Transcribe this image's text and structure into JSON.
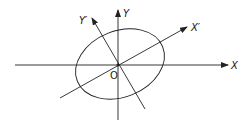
{
  "diagram": {
    "type": "rotated-axes-ellipse",
    "labels": {
      "x_axis": "X",
      "y_axis": "Y",
      "x_prime_axis": "X′",
      "y_prime_axis": "Y′",
      "origin": "O"
    },
    "colors": {
      "stroke": "#222222",
      "background": "#ffffff"
    }
  }
}
